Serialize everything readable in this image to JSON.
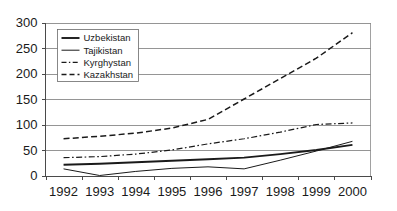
{
  "chart_data": {
    "type": "line",
    "title": "",
    "xlabel": "",
    "ylabel": "",
    "categories": [
      "1992",
      "1993",
      "1994",
      "1995",
      "1996",
      "1997",
      "1998",
      "1999",
      "2000"
    ],
    "x": [
      1992,
      1993,
      1994,
      1995,
      1996,
      1997,
      1998,
      1999,
      2000
    ],
    "ylim": [
      0,
      300
    ],
    "yticks": [
      0,
      50,
      100,
      150,
      200,
      250,
      300
    ],
    "ytick_labels": [
      "0",
      "50",
      "100",
      "150",
      "200",
      "250",
      "300"
    ],
    "grid": true,
    "legend_position": "top-left-inside",
    "series": [
      {
        "name": "Uzbekistan",
        "style": "solid-thick",
        "color": "#1a1a1a",
        "values": [
          21,
          23,
          26,
          29,
          32,
          35,
          42,
          50,
          60
        ]
      },
      {
        "name": "Tajikistan",
        "style": "solid-thin",
        "color": "#1a1a1a",
        "values": [
          13,
          0,
          8,
          14,
          17,
          13,
          30,
          48,
          67
        ]
      },
      {
        "name": "Kyrghystan",
        "style": "dash-dot",
        "color": "#1a1a1a",
        "values": [
          35,
          37,
          42,
          50,
          62,
          72,
          85,
          100,
          103
        ]
      },
      {
        "name": "Kazakhstan",
        "style": "dashed",
        "color": "#1a1a1a",
        "values": [
          72,
          77,
          83,
          93,
          110,
          150,
          190,
          230,
          280
        ]
      }
    ]
  },
  "legend": {
    "entries": [
      {
        "label": "Uzbekistan"
      },
      {
        "label": "Tajikistan"
      },
      {
        "label": "Kyrghystan"
      },
      {
        "label": "Kazakhstan"
      }
    ]
  },
  "axes": {
    "y_labels": [
      "300",
      "250",
      "200",
      "150",
      "100",
      "50",
      "0"
    ],
    "x_labels": [
      "1992",
      "1993",
      "1994",
      "1995",
      "1996",
      "1997",
      "1998",
      "1999",
      "2000"
    ]
  }
}
